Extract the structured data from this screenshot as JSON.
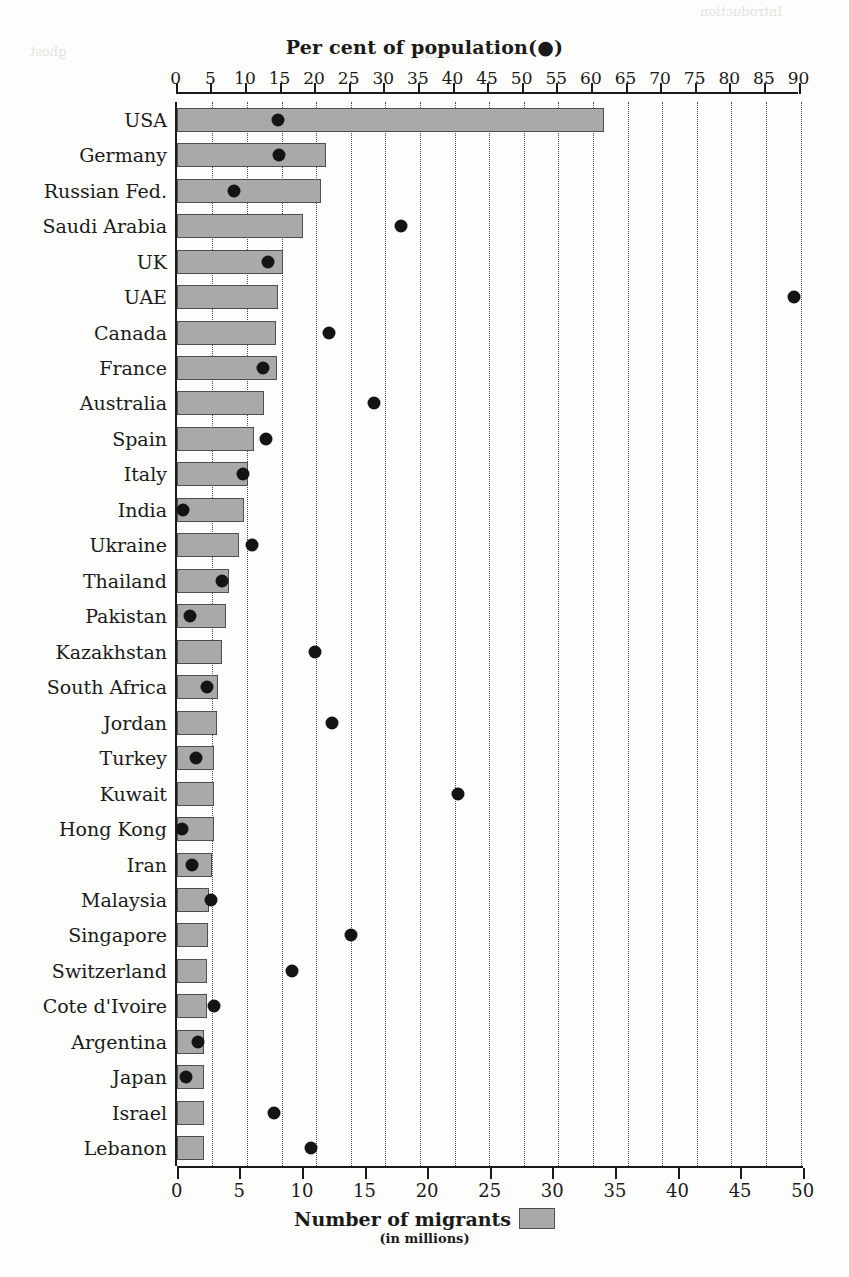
{
  "page": {
    "top_right_note": "Introduction",
    "ghost_texts": [
      "and",
      "the",
      "in",
      "of",
      "to",
      "a"
    ]
  },
  "legend": {
    "main_label": "Number of migrants",
    "sub_label": "(in millions)",
    "swatch_color": "#a9a9a9",
    "dot_color": "#141414"
  },
  "chart_data": {
    "type": "bar",
    "title": "Per cent of population(●)",
    "xlabel_top": "Per cent of population(●)",
    "xlabel_bottom": "Number of migrants (in millions)",
    "ylabel": "",
    "grid": true,
    "legend_position": "bottom-center",
    "orientation": "horizontal",
    "top_axis": {
      "name": "Per cent of population",
      "ticks": [
        0,
        5,
        10,
        15,
        20,
        25,
        30,
        35,
        40,
        45,
        50,
        55,
        60,
        65,
        70,
        75,
        80,
        85,
        90
      ],
      "min": 0,
      "max": 90,
      "step": 5
    },
    "bottom_axis": {
      "name": "Number of migrants (in millions)",
      "ticks": [
        0,
        5,
        10,
        15,
        20,
        25,
        30,
        35,
        40,
        45,
        50
      ],
      "min": 0,
      "max": 50,
      "step": 5
    },
    "categories": [
      "USA",
      "Germany",
      "Russian Fed.",
      "Saudi Arabia",
      "UK",
      "UAE",
      "Canada",
      "France",
      "Australia",
      "Spain",
      "Italy",
      "India",
      "Ukraine",
      "Thailand",
      "Pakistan",
      "Kazakhstan",
      "South Africa",
      "Jordan",
      "Turkey",
      "Kuwait",
      "Hong Kong",
      "Iran",
      "Malaysia",
      "Singapore",
      "Switzerland",
      "Cote d'Ivoire",
      "Argentina",
      "Japan",
      "Israel",
      "Lebanon"
    ],
    "series": [
      {
        "name": "Number of migrants",
        "unit": "millions",
        "axis": "bottom",
        "render": "bar",
        "values": [
          34.0,
          11.8,
          11.4,
          10.0,
          8.4,
          8.0,
          7.8,
          7.9,
          6.9,
          6.1,
          5.6,
          5.3,
          4.9,
          4.1,
          3.8,
          3.5,
          3.2,
          3.1,
          2.9,
          2.9,
          2.9,
          2.7,
          2.5,
          2.4,
          2.3,
          2.3,
          2.1,
          2.1,
          2.1,
          2.1
        ]
      },
      {
        "name": "Per cent of population",
        "unit": "percent",
        "axis": "top",
        "render": "dot",
        "values": [
          14.5,
          14.6,
          8.2,
          32.2,
          13.1,
          89.0,
          21.8,
          12.3,
          28.3,
          12.7,
          9.5,
          0.8,
          10.8,
          6.4,
          1.8,
          19.9,
          4.2,
          22.3,
          2.6,
          40.5,
          0.6,
          2.0,
          4.8,
          25.0,
          16.5,
          5.2,
          3.0,
          1.2,
          13.9,
          19.2
        ]
      }
    ]
  }
}
